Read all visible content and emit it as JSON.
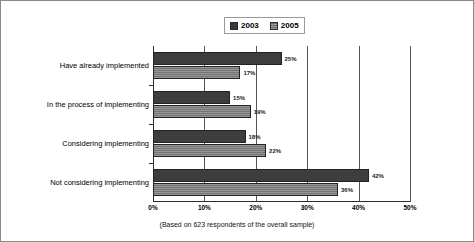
{
  "chart_data": {
    "type": "bar",
    "orientation": "horizontal",
    "title": "",
    "xlabel": "",
    "ylabel": "",
    "xlim": [
      0,
      50
    ],
    "grid": true,
    "legend_position": "top-center",
    "categories": [
      "Have already implemented",
      "In the process of implementing",
      "Considering implementing",
      "Not considering implementing"
    ],
    "series": [
      {
        "name": "2003",
        "color": "#3d3d3d",
        "values": [
          25,
          15,
          18,
          42
        ],
        "labels": [
          "25%",
          "15%",
          "18%",
          "42%"
        ]
      },
      {
        "name": "2005",
        "color": "#737373",
        "values": [
          17,
          19,
          22,
          36
        ],
        "labels": [
          "17%",
          "19%",
          "22%",
          "36%"
        ]
      }
    ],
    "xticks": [
      0,
      10,
      20,
      30,
      40,
      50
    ],
    "xtick_labels": [
      "0%",
      "10%",
      "20%",
      "30%",
      "40%",
      "50%"
    ],
    "annotations": [
      "(Based on 623 respondents of the overall sample)"
    ]
  },
  "legend": {
    "entries": [
      {
        "label": "2003",
        "swatch": "legend-swatch-2003"
      },
      {
        "label": "2005",
        "swatch": "legend-swatch-2005"
      }
    ]
  },
  "footnote": {
    "text": "(Based on 623 respondents of the overall sample)"
  }
}
